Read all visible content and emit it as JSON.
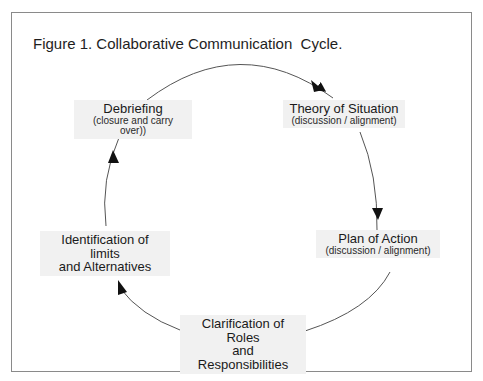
{
  "figure": {
    "title": "Figure 1. Collaborative Communication  Cycle.",
    "nodes": [
      {
        "id": "debriefing",
        "label": "Debriefing",
        "sub": "(closure and carry over))"
      },
      {
        "id": "theory",
        "label": "Theory of Situation",
        "sub": "(discussion / alignment)"
      },
      {
        "id": "plan",
        "label": "Plan of Action",
        "sub": "(discussion / alignment)"
      },
      {
        "id": "roles",
        "label": "Clarification of Roles",
        "label2": "and Responsibilities"
      },
      {
        "id": "limits",
        "label": "Identification of limits",
        "label2": "and Alternatives"
      }
    ],
    "cycle_order": [
      "Debriefing",
      "Theory of Situation",
      "Plan of Action",
      "Clarification of Roles and Responsibilities",
      "Identification of limits and Alternatives"
    ]
  }
}
